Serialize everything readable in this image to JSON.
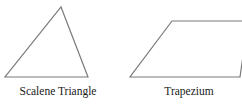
{
  "figure": {
    "background_color": "#ffffff",
    "stroke_color": "#7a7a7a",
    "text_color": "#1a1a1a",
    "shapes": [
      {
        "name": "scalene-triangle",
        "label": "Scalene Triangle",
        "type": "polygon",
        "points": "61,7 88,77 5,77"
      },
      {
        "name": "trapezium",
        "label": "Trapezium",
        "type": "polygon",
        "points": "172,21 248,21 240,77 130,77"
      }
    ]
  },
  "captions": {
    "triangle": "Scalene Triangle",
    "trapezium": "Trapezium"
  }
}
